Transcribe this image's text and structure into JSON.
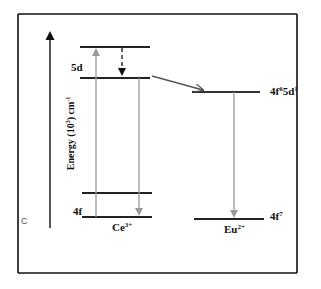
{
  "diagram": {
    "type": "energy-level-diagram",
    "y_axis_label": "Energy (10",
    "y_axis_label_sup": "3",
    "y_axis_label_unit": ") cm",
    "y_axis_label_unit_sup": "-1",
    "corner_mark": "C",
    "ions": [
      {
        "name": "Ce",
        "charge": "3+",
        "levels": [
          {
            "label": "5d",
            "role": "upper 5d"
          },
          {
            "label": "",
            "role": "relaxed 5d"
          },
          {
            "label": "",
            "role": "4f excited"
          },
          {
            "label": "4f",
            "role": "ground"
          }
        ]
      },
      {
        "name": "Eu",
        "charge": "2+",
        "levels": [
          {
            "label_main": "4f",
            "label_sup1": "6",
            "label_mid": "5d",
            "label_sup2": "1",
            "role": "excited"
          },
          {
            "label_main": "4f",
            "label_sup1": "7",
            "role": "ground"
          }
        ]
      }
    ],
    "transitions": [
      {
        "from": "Ce 4f ground",
        "to": "Ce 5d upper",
        "style": "grey solid arrow",
        "kind": "absorption"
      },
      {
        "from": "Ce 5d upper",
        "to": "Ce 5d relaxed",
        "style": "black dashed arrow",
        "kind": "non-radiative relaxation"
      },
      {
        "from": "Ce 5d relaxed",
        "to": "Ce 4f ground",
        "style": "grey solid arrow",
        "kind": "emission"
      },
      {
        "from": "Ce 5d relaxed",
        "to": "Eu 4f65d1",
        "style": "grey diagonal arrow",
        "kind": "energy transfer"
      },
      {
        "from": "Eu 4f65d1",
        "to": "Eu 4f7",
        "style": "grey solid arrow",
        "kind": "emission"
      }
    ]
  },
  "labels": {
    "ce_5d": "5d",
    "ce_4f": "4f",
    "ce_name": "Ce",
    "ce_charge": "3+",
    "eu_excited_a": "4f",
    "eu_excited_sup1": "6",
    "eu_excited_b": "5d",
    "eu_excited_sup2": "1",
    "eu_ground_a": "4f",
    "eu_ground_sup": "7",
    "eu_name": "Eu",
    "eu_charge": "2+"
  },
  "colors": {
    "frame": "#111111",
    "level_line": "#222222",
    "transition_grey": "#9a9a9a",
    "energy_transfer": "#555555"
  }
}
